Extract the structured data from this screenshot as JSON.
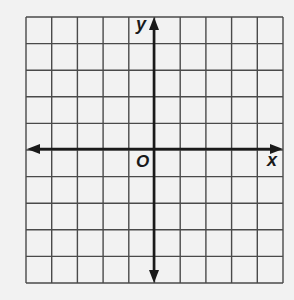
{
  "diagram": {
    "type": "coordinate-plane",
    "grid": {
      "columns": 10,
      "rows": 10,
      "left": 26,
      "top": 17,
      "right": 283,
      "bottom": 283
    },
    "axes": {
      "x_label": "x",
      "y_label": "y",
      "origin_label": "O",
      "x_axis_y": 149,
      "y_axis_x": 154
    },
    "colors": {
      "background": "#f2f2f2",
      "grid_line": "#4a4a4a",
      "axis": "#1a1a1a"
    }
  }
}
